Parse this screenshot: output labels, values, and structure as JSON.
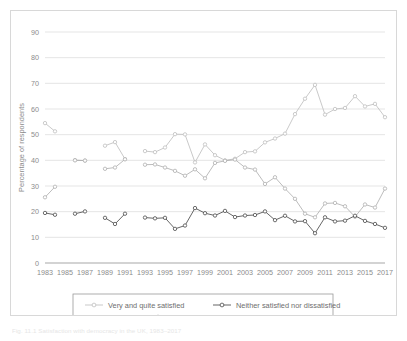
{
  "caption": "Fig. 11.1  Satisfaction with democracy in the UK, 1983–2017",
  "chart_data": {
    "type": "line",
    "title": "",
    "xlabel": "",
    "ylabel": "Percentage of respondents",
    "ylim": [
      0,
      90
    ],
    "yticks": [
      0,
      10,
      20,
      30,
      40,
      50,
      60,
      70,
      80,
      90
    ],
    "xlim": [
      1983,
      2017
    ],
    "xticks": [
      1983,
      1985,
      1987,
      1989,
      1991,
      1993,
      1995,
      1997,
      1999,
      2001,
      2003,
      2005,
      2007,
      2009,
      2011,
      2013,
      2015,
      2017
    ],
    "grid": true,
    "legend_position": "bottom",
    "series": [
      {
        "name": "Very and quite satisfied",
        "color": "#bfbfbf",
        "marker": "circle-open",
        "points": [
          [
            1983,
            54.5
          ],
          [
            1984,
            51.3
          ],
          [
            1986,
            40.1
          ],
          [
            1987,
            39.9
          ],
          [
            1989,
            45.7
          ],
          [
            1990,
            47.1
          ],
          [
            1991,
            40.5
          ],
          [
            1993,
            43.6
          ],
          [
            1994,
            43.2
          ],
          [
            1995,
            45.0
          ],
          [
            1996,
            50.2
          ],
          [
            1997,
            50.1
          ],
          [
            1998,
            39.2
          ],
          [
            1999,
            46.2
          ],
          [
            2000,
            42.0
          ],
          [
            2001,
            40.0
          ],
          [
            2002,
            40.6
          ],
          [
            2003,
            43.2
          ],
          [
            2004,
            43.5
          ],
          [
            2005,
            47.0
          ],
          [
            2006,
            48.5
          ],
          [
            2007,
            50.4
          ],
          [
            2008,
            58.0
          ],
          [
            2009,
            64.0
          ],
          [
            2010,
            69.4
          ],
          [
            2011,
            57.8
          ],
          [
            2012,
            60.0
          ],
          [
            2013,
            60.4
          ],
          [
            2014,
            65.0
          ],
          [
            2015,
            61.0
          ],
          [
            2016,
            62.0
          ],
          [
            2017,
            56.8
          ]
        ]
      },
      {
        "name": "Neither satisfied nor dissatisfied",
        "color": "#4a4a4a",
        "marker": "circle-open",
        "points": [
          [
            1983,
            19.5
          ],
          [
            1984,
            18.8
          ],
          [
            1986,
            19.2
          ],
          [
            1987,
            20.1
          ],
          [
            1989,
            17.6
          ],
          [
            1990,
            15.2
          ],
          [
            1991,
            19.2
          ],
          [
            1993,
            17.7
          ],
          [
            1994,
            17.4
          ],
          [
            1995,
            17.6
          ],
          [
            1996,
            13.3
          ],
          [
            1997,
            14.6
          ],
          [
            1998,
            21.4
          ],
          [
            1999,
            19.4
          ],
          [
            2000,
            18.5
          ],
          [
            2001,
            20.3
          ],
          [
            2002,
            17.9
          ],
          [
            2003,
            18.5
          ],
          [
            2004,
            18.7
          ],
          [
            2005,
            20.1
          ],
          [
            2006,
            16.7
          ],
          [
            2007,
            18.4
          ],
          [
            2008,
            16.2
          ],
          [
            2009,
            16.3
          ],
          [
            2010,
            11.6
          ],
          [
            2011,
            17.8
          ],
          [
            2012,
            16.2
          ],
          [
            2013,
            16.5
          ],
          [
            2014,
            18.4
          ],
          [
            2015,
            16.4
          ],
          [
            2016,
            15.2
          ],
          [
            2017,
            13.7
          ]
        ]
      },
      {
        "name": "Very and quite dissatisfied",
        "color": "#b0b0b0",
        "marker": "circle-open",
        "points": [
          [
            1983,
            25.6
          ],
          [
            1984,
            29.7
          ],
          [
            1986,
            40.0
          ],
          [
            1987,
            39.9
          ],
          [
            1989,
            36.7
          ],
          [
            1990,
            37.2
          ],
          [
            1991,
            40.4
          ],
          [
            1993,
            38.3
          ],
          [
            1994,
            38.4
          ],
          [
            1995,
            37.2
          ],
          [
            1996,
            35.9
          ],
          [
            1997,
            34.0
          ],
          [
            1998,
            36.5
          ],
          [
            1999,
            33.0
          ],
          [
            2000,
            39.0
          ],
          [
            2001,
            39.8
          ],
          [
            2002,
            40.3
          ],
          [
            2003,
            37.2
          ],
          [
            2004,
            36.4
          ],
          [
            2005,
            30.8
          ],
          [
            2006,
            33.4
          ],
          [
            2007,
            29.0
          ],
          [
            2008,
            25.0
          ],
          [
            2009,
            19.2
          ],
          [
            2010,
            17.8
          ],
          [
            2011,
            23.2
          ],
          [
            2012,
            23.4
          ],
          [
            2013,
            22.1
          ],
          [
            2014,
            18.0
          ],
          [
            2015,
            22.8
          ],
          [
            2016,
            21.6
          ],
          [
            2017,
            29.0
          ]
        ]
      }
    ]
  },
  "legend": {
    "entries": [
      {
        "label": "Very and quite satisfied"
      },
      {
        "label": "Neither satisfied nor dissatisfied"
      },
      {
        "label": "Very and quite dissatisfied"
      }
    ]
  }
}
